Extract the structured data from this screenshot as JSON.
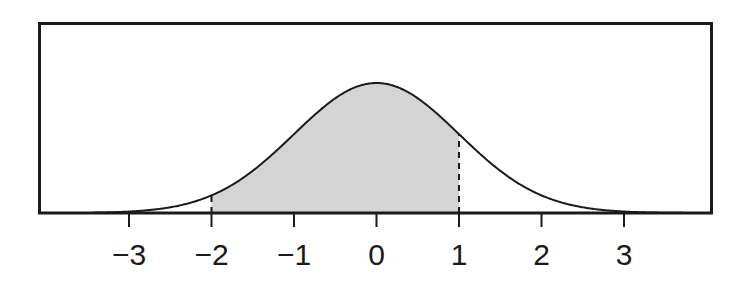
{
  "figure": {
    "kind": "normal-distribution-shaded-area",
    "background_color": "#ffffff",
    "frame": {
      "left": 38,
      "top": 22,
      "right": 713,
      "bottom": 213,
      "stroke_color": "#1a1a1a",
      "stroke_width": 3
    },
    "axis": {
      "baseline_y": 213,
      "tick_length": 13,
      "tick_color": "#1a1a1a",
      "tick_width": 2,
      "label_color": "#1a1a1a",
      "label_font_size": 30,
      "label_baseline_y": 240,
      "px_per_unit": 82.5,
      "origin_x": 376.5
    },
    "curve": {
      "stroke_color": "#1a1a1a",
      "stroke_width": 2,
      "peak_x": 376.5,
      "peak_y": 83,
      "height_px": 130
    },
    "shading": {
      "fill_color": "#d4d4d4",
      "from": -2,
      "to": 1
    },
    "markers": {
      "dash_color": "#1a1a1a",
      "dash_width": 2,
      "dash_pattern": "6 5",
      "positions": [
        -2,
        1
      ]
    }
  },
  "chart_data": {
    "type": "area",
    "title": "",
    "subtitle": "",
    "xlabel": "",
    "ylabel": "",
    "grid": false,
    "legend_position": "none",
    "xlim": [
      -3.45,
      4.05
    ],
    "ylim": [
      0,
      0.43
    ],
    "xticks": [
      -3,
      -2,
      -1,
      0,
      1,
      2,
      3
    ],
    "xticklabels": [
      "−3",
      "−2",
      "−1",
      "0",
      "1",
      "2",
      "3"
    ],
    "yticks": [],
    "yticklabels": [],
    "annotations": [
      {
        "type": "vertical-dashed-line",
        "x": -2
      },
      {
        "type": "vertical-dashed-line",
        "x": 1
      }
    ],
    "shaded_interval": {
      "from": -2,
      "to": 1,
      "fill": "#d4d4d4"
    },
    "series": [
      {
        "name": "standard normal density",
        "distribution": "normal",
        "mean": 0,
        "sd": 1,
        "x": [
          -3.4,
          -3.2,
          -3.0,
          -2.8,
          -2.6,
          -2.4,
          -2.2,
          -2.0,
          -1.8,
          -1.6,
          -1.4,
          -1.2,
          -1.0,
          -0.8,
          -0.6,
          -0.4,
          -0.2,
          0.0,
          0.2,
          0.4,
          0.6,
          0.8,
          1.0,
          1.2,
          1.4,
          1.6,
          1.8,
          2.0,
          2.2,
          2.4,
          2.6,
          2.8,
          3.0,
          3.2,
          3.4
        ],
        "values": [
          0.001,
          0.002,
          0.004,
          0.008,
          0.014,
          0.022,
          0.035,
          0.054,
          0.079,
          0.111,
          0.15,
          0.194,
          0.242,
          0.29,
          0.333,
          0.368,
          0.391,
          0.399,
          0.391,
          0.368,
          0.333,
          0.29,
          0.242,
          0.194,
          0.15,
          0.111,
          0.079,
          0.054,
          0.035,
          0.022,
          0.014,
          0.008,
          0.004,
          0.002,
          0.001
        ]
      }
    ]
  },
  "labels": [
    {
      "text": "−3",
      "x": 129.0
    },
    {
      "text": "−2",
      "x": 211.5
    },
    {
      "text": "−1",
      "x": 294.0
    },
    {
      "text": "0",
      "x": 376.5
    },
    {
      "text": "1",
      "x": 459.0
    },
    {
      "text": "2",
      "x": 541.5
    },
    {
      "text": "3",
      "x": 624.0
    }
  ]
}
